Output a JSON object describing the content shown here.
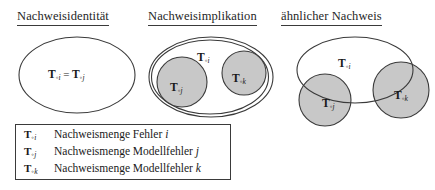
{
  "figure": {
    "background_color": "#ffffff",
    "line_color": "#3a3a3a",
    "shaded_fill_color": "#c8c8c8",
    "panels": [
      {
        "id": "identity",
        "heading": "Nachweisidentität",
        "shapes": [
          {
            "name": "ellipse-Toi-Toj",
            "fill": "#ffffff"
          }
        ],
        "labels": [
          {
            "name": "label-equality",
            "base": "T",
            "sub_ring": "◦",
            "sub_index": "i",
            "operator": "=",
            "base2": "T",
            "sub_ring2": "◦",
            "sub_index2": "j",
            "text": "T◦i = T◦j"
          }
        ]
      },
      {
        "id": "implication",
        "heading": "Nachweisimplikation",
        "shapes": [
          {
            "name": "ellipse-Toi",
            "fill": "#ffffff"
          },
          {
            "name": "circle-Toj",
            "fill": "#c8c8c8"
          },
          {
            "name": "circle-Tok",
            "fill": "#c8c8c8"
          }
        ],
        "labels": [
          {
            "name": "label-Toi",
            "base": "T",
            "sub_ring": "◦",
            "sub_index": "i",
            "text": "T◦i"
          },
          {
            "name": "label-Toj",
            "base": "T",
            "sub_ring": "◦",
            "sub_index": "j",
            "text": "T◦j"
          },
          {
            "name": "label-Tok",
            "base": "T",
            "sub_ring": "◦",
            "sub_index": "k",
            "text": "T◦k"
          }
        ]
      },
      {
        "id": "similar",
        "heading": "ähnlicher Nachweis",
        "shapes": [
          {
            "name": "ellipse-Toi",
            "fill": "#ffffff"
          },
          {
            "name": "circle-Toj",
            "fill": "#c8c8c8"
          },
          {
            "name": "circle-Tok",
            "fill": "#c8c8c8"
          }
        ],
        "labels": [
          {
            "name": "label-Toi",
            "base": "T",
            "sub_ring": "◦",
            "sub_index": "i",
            "text": "T◦i"
          },
          {
            "name": "label-Toj",
            "base": "T",
            "sub_ring": "◦",
            "sub_index": "j",
            "text": "T◦j"
          },
          {
            "name": "label-Tok",
            "base": "T",
            "sub_ring": "◦",
            "sub_index": "k",
            "text": "T◦k"
          }
        ]
      }
    ]
  },
  "legend": {
    "rows": [
      {
        "symbol_base": "T",
        "symbol_ring": "◦",
        "symbol_index": "i",
        "description": "Nachweismenge Fehler",
        "description_index": "i"
      },
      {
        "symbol_base": "T",
        "symbol_ring": "◦",
        "symbol_index": "j",
        "description": "Nachweismenge Modellfehler",
        "description_index": "j"
      },
      {
        "symbol_base": "T",
        "symbol_ring": "◦",
        "symbol_index": "k",
        "description": "Nachweismenge Modellfehler",
        "description_index": "k"
      }
    ]
  },
  "math_symbols": {
    "equals": "=",
    "ring_operator": "◦"
  }
}
